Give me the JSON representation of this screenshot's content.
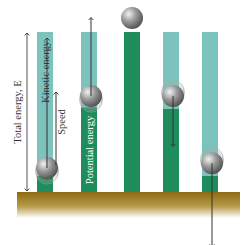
{
  "axis": {
    "label": "Total energy, E"
  },
  "labels": {
    "kinetic": "Kinetic energy",
    "potential": "Potential energy",
    "speed": "Speed"
  },
  "colors": {
    "kinetic": "#7cc2bd",
    "potential": "#1e8c5c",
    "ground_top": "#8d6a12",
    "ground_bottom": "#ffffff",
    "ball": "#8a8a8a",
    "arrow": "#333333"
  },
  "stages": [
    {
      "name": "rising-low",
      "potential_fraction": 0.1,
      "ball_motion": "up",
      "speed_fraction": 0.58,
      "ball_position_fraction": 0.15
    },
    {
      "name": "rising-mid",
      "potential_fraction": 0.53,
      "ball_motion": "up",
      "speed_fraction": 0.35,
      "ball_position_fraction": 0.6
    },
    {
      "name": "top",
      "potential_fraction": 1.0,
      "ball_motion": "none",
      "speed_fraction": 0.0,
      "ball_position_fraction": 1.0
    },
    {
      "name": "falling-mid",
      "potential_fraction": 0.52,
      "ball_motion": "down",
      "speed_fraction": 0.35,
      "ball_position_fraction": 0.6
    },
    {
      "name": "falling-low",
      "potential_fraction": 0.1,
      "ball_motion": "down",
      "speed_fraction": 0.58,
      "ball_position_fraction": 0.18
    }
  ]
}
